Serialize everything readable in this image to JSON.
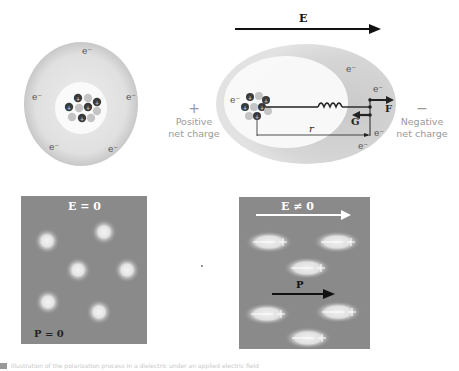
{
  "neutral_atom": {
    "electron_label": "e⁻",
    "electron_count": 5,
    "nucleus_charge_symbol": "+"
  },
  "polarized_atom": {
    "field_label": "E",
    "force_label": "F",
    "restoring_force_label": "G",
    "distance_label": "r",
    "electron_label": "e⁻",
    "positive_side": {
      "symbol": "+",
      "label_line1": "Positive",
      "label_line2": "net charge"
    },
    "negative_side": {
      "symbol": "−",
      "label_line1": "Negative",
      "label_line2": "net charge"
    }
  },
  "panel_no_field": {
    "field_label": "E = 0",
    "polarization_label": "P = 0",
    "molecule_count": 6
  },
  "panel_with_field": {
    "field_label": "E ≠ 0",
    "polarization_label": "P",
    "molecule_count": 6,
    "dipole_symbols": {
      "minus": "−",
      "plus": "+"
    }
  },
  "caption": "Illustration of the polarization process in a dielectric under an applied electric field",
  "colors": {
    "panel_bg": "#8a8a8a",
    "cloud": "#d9d9d9",
    "proton": "#3a3a3a",
    "neutron": "#c4c4c4",
    "label_gray": "#9a9a9a"
  }
}
